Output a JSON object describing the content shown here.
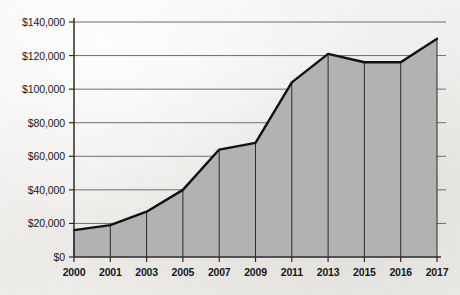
{
  "chart_data": {
    "type": "area",
    "title": "",
    "subtitle": "",
    "xlabel": "",
    "ylabel": "",
    "categories": [
      "2000",
      "2001",
      "2003",
      "2005",
      "2007",
      "2009",
      "2011",
      "2013",
      "2015",
      "2016",
      "2017"
    ],
    "values": [
      16000,
      19000,
      27000,
      40000,
      64000,
      68000,
      104000,
      121000,
      116000,
      116000,
      130000
    ],
    "ylim": [
      0,
      140000
    ],
    "ytick_values": [
      0,
      20000,
      40000,
      60000,
      80000,
      100000,
      120000,
      140000
    ],
    "ytick_labels": [
      "$0",
      "$20,000",
      "$40,000",
      "$60,000",
      "$80,000",
      "$100,000",
      "$120,000",
      "$140,000"
    ],
    "xtick_labels": [
      "2000",
      "2001",
      "2003",
      "2005",
      "2007",
      "2009",
      "2011",
      "2013",
      "2015",
      "2016",
      "2017"
    ],
    "grid": "horizontal",
    "legend": "none",
    "series": [
      {
        "name": "value",
        "values": [
          16000,
          19000,
          27000,
          40000,
          64000,
          68000,
          104000,
          121000,
          116000,
          116000,
          130000
        ]
      }
    ],
    "colors": {
      "area_fill": "#b2b2b2",
      "line": "#111111",
      "gridline": "#6e6e6e",
      "axis": "#2b2b2b",
      "category_rule": "#2b2b2b",
      "text": "#17171a",
      "background": "#f1f0ee"
    },
    "geometry": {
      "plot_left": 74,
      "plot_right": 437,
      "plot_top": 22,
      "plot_bottom": 257,
      "gridline_overhang_right": 9
    }
  }
}
